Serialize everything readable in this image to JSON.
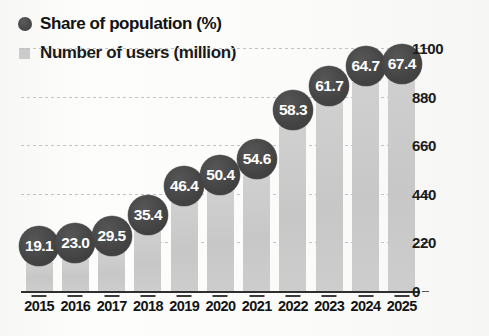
{
  "chart_data": {
    "type": "bar",
    "title": "",
    "subtitle": "",
    "xlabel": "",
    "ylabel": "",
    "categories": [
      "2015",
      "2016",
      "2017",
      "2018",
      "2019",
      "2020",
      "2021",
      "2022",
      "2023",
      "2024",
      "2025"
    ],
    "ylim": [
      0,
      1100
    ],
    "yticks": [
      0,
      220,
      440,
      660,
      880,
      1100
    ],
    "ytick_labels": [
      "0",
      "220",
      "440",
      "660",
      "880",
      "1100"
    ],
    "grid": true,
    "legend_position": "top-left",
    "series": [
      {
        "name": "Number of users (million)",
        "type": "bar",
        "axis": "left",
        "color": "#cccccc",
        "values": [
          132,
          145,
          177,
          272,
          404,
          454,
          526,
          748,
          857,
          948,
          1034
        ]
      },
      {
        "name": "Share of population (%)",
        "type": "bubble",
        "axis": "annotation",
        "color": "#474747",
        "values": [
          19.1,
          23.0,
          29.5,
          35.4,
          46.4,
          50.4,
          54.6,
          58.3,
          61.7,
          64.7,
          67.4
        ],
        "labels": [
          "19.1",
          "23.0",
          "29.5",
          "35.4",
          "46.4",
          "50.4",
          "54.6",
          "58.3",
          "61.7",
          "64.7",
          "67.4"
        ]
      }
    ]
  },
  "legend": {
    "items": [
      {
        "label": "Share of population (%)",
        "marker": "circle",
        "color": "#474747"
      },
      {
        "label": "Number of users (million)",
        "marker": "square",
        "color": "#cbcbcb"
      }
    ]
  }
}
